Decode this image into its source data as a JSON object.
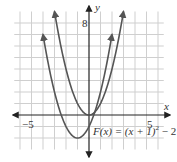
{
  "chart_data": {
    "type": "line",
    "title": "",
    "xlabel": "x",
    "ylabel": "y",
    "xlim": [
      -7,
      7
    ],
    "ylim": [
      -3,
      9
    ],
    "grid": true,
    "tick_labels": {
      "x": [
        "-5",
        "5"
      ],
      "y": [
        "8"
      ]
    },
    "series": [
      {
        "name": "y = x^2",
        "expression": "x^2",
        "vertex": [
          0,
          0
        ],
        "x_range": [
          -3,
          3
        ]
      },
      {
        "name": "F(x) = (x+1)^2 - 2",
        "expression": "(x+1)^2 - 2",
        "vertex": [
          -1,
          -2
        ],
        "x_range": [
          -4,
          2
        ]
      }
    ],
    "annotations": [
      {
        "text": "F(x) = (x + 1)^2 − 2",
        "position": "below-right of vertex"
      }
    ]
  },
  "labels": {
    "x_axis": "x",
    "y_axis": "y",
    "x_neg": "−5",
    "x_pos": "5",
    "y_top": "8",
    "func_prefix": "F(x) = (x + 1)",
    "func_exp": "2",
    "func_suffix": " − 2"
  },
  "colors": {
    "curve": "#555555",
    "axis": "#222222",
    "grid": "#cfcfcf"
  }
}
